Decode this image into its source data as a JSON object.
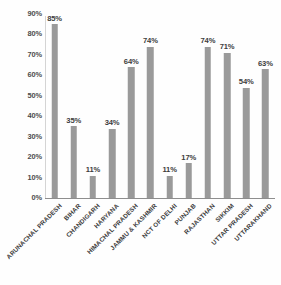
{
  "chart_data": {
    "type": "bar",
    "title": "",
    "subtitle": "",
    "xlabel": "",
    "ylabel": "",
    "ylim": [
      0,
      90
    ],
    "grid": false,
    "legend": null,
    "orientation": "vertical",
    "bar_color": "#9a9a9a",
    "axis_color": "#8e8e8e",
    "text_color": "#3d3d3d",
    "background_color": "#fefefe",
    "categories": [
      "ARUNACHAL PRADESH",
      "BIHAR",
      "CHANDIGARH",
      "HARYANA",
      "HIMACHAL PRADESH",
      "JAMMU & KASHMIR",
      "NCT OF DELHI",
      "PUNJAB",
      "RAJASTHAN",
      "SIKKIM",
      "UTTAR PRADESH",
      "UTTARAKHAND"
    ],
    "values": [
      85,
      35,
      11,
      34,
      64,
      74,
      11,
      17,
      74,
      71,
      54,
      63
    ],
    "data_labels": [
      "85%",
      "35%",
      "11%",
      "34%",
      "64%",
      "74%",
      "11%",
      "17%",
      "74%",
      "71%",
      "54%",
      "63%"
    ],
    "y_ticks": [
      0,
      10,
      20,
      30,
      40,
      50,
      60,
      70,
      80,
      90
    ],
    "y_tick_labels": [
      "0%",
      "10%",
      "20%",
      "30%",
      "40%",
      "50%",
      "60%",
      "70%",
      "80%",
      "90%"
    ]
  }
}
